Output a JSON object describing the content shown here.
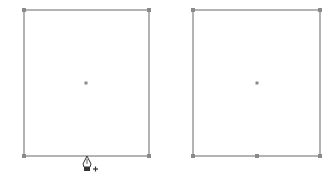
{
  "colors": {
    "stroke": "#9a9a9a",
    "anchor": "#8a8a8a",
    "background": "#ffffff"
  },
  "shapes": [
    {
      "name": "left-rectangle",
      "x": 24,
      "y": 10,
      "width": 125,
      "height": 146,
      "anchors": [
        [
          24,
          10
        ],
        [
          149,
          10
        ],
        [
          24,
          156
        ],
        [
          149,
          156
        ]
      ],
      "center": [
        86,
        83
      ]
    },
    {
      "name": "right-rectangle",
      "x": 193,
      "y": 10,
      "width": 127,
      "height": 146,
      "anchors": [
        [
          193,
          10
        ],
        [
          320,
          10
        ],
        [
          193,
          156
        ],
        [
          257,
          156
        ],
        [
          320,
          156
        ]
      ],
      "center": [
        257,
        83
      ]
    }
  ],
  "cursor": {
    "icon": "pen-add-anchor-icon",
    "x": 87,
    "y": 157
  }
}
